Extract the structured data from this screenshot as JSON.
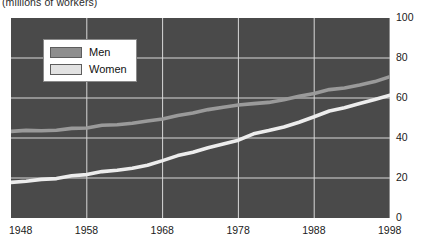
{
  "caption": {
    "units": "(millions of workers)"
  },
  "legend": {
    "position": "inside-top-left",
    "items": [
      {
        "label": "Men",
        "color": "#8e8e8e",
        "name": "men"
      },
      {
        "label": "Women",
        "color": "#e2e2e2",
        "name": "women"
      }
    ]
  },
  "axes": {
    "y_ticks": [
      "0",
      "20",
      "40",
      "60",
      "80",
      "100"
    ],
    "x_ticks": [
      "1948",
      "1958",
      "1968",
      "1978",
      "1988",
      "1998"
    ]
  },
  "colors": {
    "plot_background": "#4a4a4a",
    "gridline": "#d8d8d8",
    "men_line": "#9a9a9a",
    "women_line": "#ededed",
    "text": "#1a1a1a"
  },
  "chart_data": {
    "type": "line",
    "title": "",
    "subtitle": "",
    "xlabel": "",
    "ylabel": "(millions of workers)",
    "xlim": [
      1948,
      1998
    ],
    "ylim": [
      0,
      100
    ],
    "grid": true,
    "legend_position": "inside-top-left",
    "x": [
      1948,
      1950,
      1952,
      1954,
      1956,
      1958,
      1960,
      1962,
      1964,
      1966,
      1968,
      1970,
      1972,
      1974,
      1976,
      1978,
      1980,
      1982,
      1984,
      1986,
      1988,
      1990,
      1992,
      1994,
      1996,
      1998
    ],
    "series": [
      {
        "name": "Men",
        "color": "#9a9a9a",
        "values": [
          43.3,
          43.8,
          43.6,
          43.9,
          44.8,
          45.0,
          46.4,
          46.6,
          47.4,
          48.5,
          49.5,
          51.2,
          52.5,
          54.2,
          55.4,
          56.5,
          57.2,
          57.8,
          59.1,
          60.9,
          62.3,
          64.2,
          65.0,
          66.5,
          68.2,
          70.7
        ]
      },
      {
        "name": "Women",
        "color": "#ededed",
        "values": [
          17.8,
          18.4,
          19.3,
          19.7,
          21.1,
          21.7,
          23.2,
          23.9,
          24.9,
          26.4,
          28.7,
          31.2,
          32.9,
          35.1,
          37.0,
          38.9,
          42.1,
          43.7,
          45.5,
          47.9,
          50.6,
          53.5,
          55.1,
          57.2,
          59.2,
          61.4
        ]
      }
    ]
  }
}
